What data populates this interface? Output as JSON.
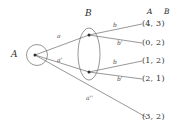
{
  "figure": {
    "sets": {
      "a_label": "A",
      "b_label": "B"
    },
    "columns": {
      "head_a": "A",
      "head_b": "B"
    },
    "edges": [
      {
        "name": "a",
        "label": "a"
      },
      {
        "name": "a1",
        "label": "a'"
      },
      {
        "name": "a2",
        "label": "a''"
      },
      {
        "name": "b_top",
        "label": "b"
      },
      {
        "name": "b1_top",
        "label": "b'"
      },
      {
        "name": "b_bottom",
        "label": "b"
      },
      {
        "name": "b1_bottom",
        "label": "b'"
      }
    ],
    "pairs": [
      {
        "text": "(4, 3)",
        "a": "4",
        "b": "3"
      },
      {
        "text": "(0, 2)",
        "a": "0",
        "b": "2"
      },
      {
        "text": "(1, 2)",
        "a": "1",
        "b": "2"
      },
      {
        "text": "(2, 1)",
        "a": "2",
        "b": "1"
      },
      {
        "text": "(3, 2)",
        "a": "3",
        "b": "2"
      }
    ],
    "colors": {
      "stroke": "#5a5a5a",
      "text": "#2e2e2e",
      "background": "#ffffff"
    }
  }
}
